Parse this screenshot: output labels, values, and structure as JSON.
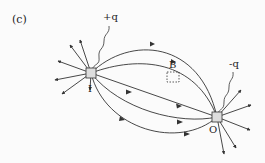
{
  "figure": {
    "panel_label": "(c)",
    "positive_charge_label": "+q",
    "negative_charge_label": "-q",
    "source_node_label": "I",
    "sink_node_label": "O",
    "region_label": "B"
  },
  "colors": {
    "line": "#333333",
    "background": "#fbfbfb"
  }
}
